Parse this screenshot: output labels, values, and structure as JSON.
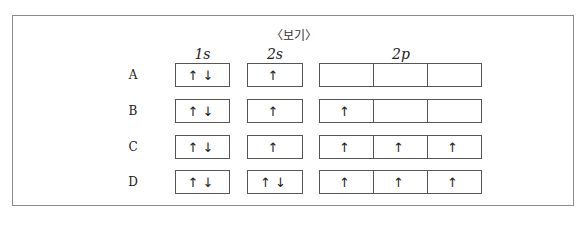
{
  "title": "〈보기〉",
  "headers": {
    "s1": "1s",
    "s2": "2s",
    "p2": "2p"
  },
  "rows": [
    {
      "label": "A",
      "s1": "↑↓",
      "s2": "↑",
      "p": [
        "",
        "",
        ""
      ]
    },
    {
      "label": "B",
      "s1": "↑↓",
      "s2": "↑",
      "p": [
        "↑",
        "",
        ""
      ]
    },
    {
      "label": "C",
      "s1": "↑↓",
      "s2": "↑",
      "p": [
        "↑",
        "↑",
        "↑"
      ]
    },
    {
      "label": "D",
      "s1": "↑↓",
      "s2": "↑↓",
      "p": [
        "↑",
        "↑",
        "↑"
      ]
    }
  ]
}
